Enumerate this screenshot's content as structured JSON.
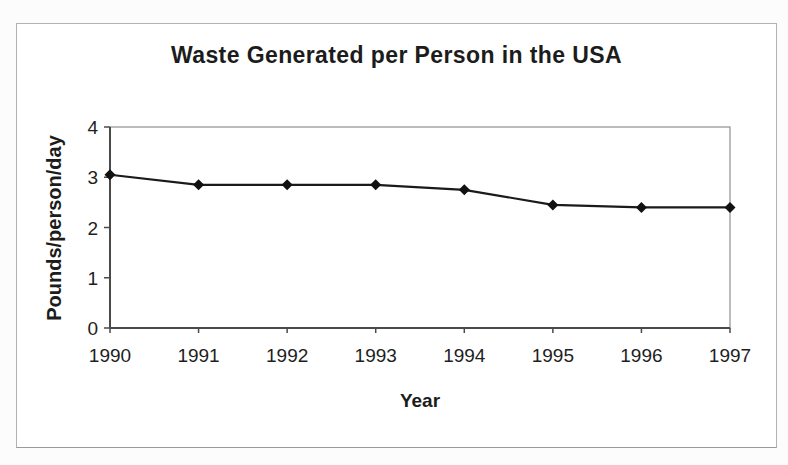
{
  "window": {
    "background_color": "#ffffff",
    "frame_border_color": "#b2b2b2"
  },
  "chart_data": {
    "type": "line",
    "title": "Waste Generated per Person in the USA",
    "xlabel": "Year",
    "ylabel": "Pounds/person/day",
    "categories": [
      "1990",
      "1991",
      "1992",
      "1993",
      "1994",
      "1995",
      "1996",
      "1997"
    ],
    "values": [
      3.05,
      2.85,
      2.85,
      2.85,
      2.75,
      2.45,
      2.4,
      2.4
    ],
    "ylim": [
      0,
      4
    ],
    "yticks": [
      0,
      1,
      2,
      3,
      4
    ],
    "grid": false,
    "legend": "none",
    "marker": "diamond",
    "line_color": "#1a1a1a",
    "marker_color": "#111111",
    "axis_color": "#4a4a4a",
    "plot_border_color": "#8f8f8f",
    "text_color": "#1e1e1e"
  }
}
